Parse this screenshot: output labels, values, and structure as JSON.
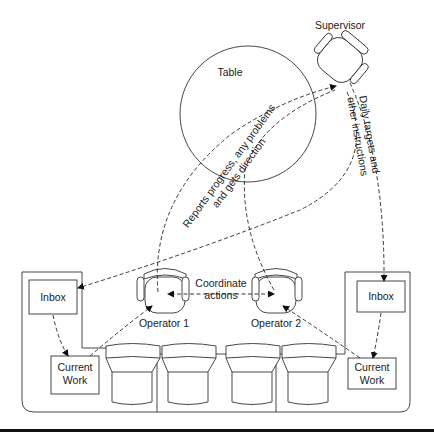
{
  "diagram": {
    "type": "workplace-layout",
    "nodes": {
      "supervisor": {
        "label": "Supervisor"
      },
      "table": {
        "label": "Table"
      },
      "operator1": {
        "label": "Operator 1"
      },
      "operator2": {
        "label": "Operator 2"
      },
      "inbox_left": {
        "label": "Inbox"
      },
      "inbox_right": {
        "label": "Inbox"
      },
      "current_work_left": {
        "line1": "Current",
        "line2": "Work"
      },
      "current_work_right": {
        "line1": "Current",
        "line2": "Work"
      }
    },
    "edges": {
      "reports": {
        "line1": "Reports progress, any problems",
        "line2": "and gets direction"
      },
      "daily": {
        "line1": "Daily targets and",
        "line2": "other instructions"
      },
      "coordinate": {
        "line1": "Coordinate",
        "line2": "actions"
      }
    },
    "consoles": {
      "count": 4
    }
  }
}
